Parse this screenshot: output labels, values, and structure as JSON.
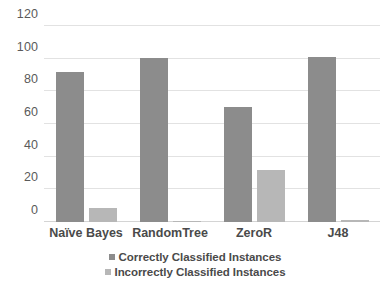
{
  "chart_data": {
    "type": "bar",
    "title": "",
    "xlabel": "",
    "ylabel": "",
    "categories": [
      "Naïve Bayes",
      "RandomTree",
      "ZeroR",
      "J48"
    ],
    "series": [
      {
        "name": "Correctly Classified Instances",
        "color": "#8c8c8c",
        "values": [
          92,
          100.7,
          70.3,
          101
        ]
      },
      {
        "name": "Incorrectly Classified Instances",
        "color": "#b7b7b7",
        "values": [
          8.5,
          0.4,
          31.6,
          1.2
        ]
      }
    ],
    "ylim": [
      0,
      120
    ],
    "yticks": [
      0,
      20,
      40,
      60,
      80,
      100,
      120
    ],
    "ytick_labels": [
      "0",
      "20",
      "40",
      "60",
      "80",
      "100",
      "120"
    ],
    "grid": true,
    "grid_color": "#e2e2e2",
    "legend_position": "bottom",
    "background": "#ffffff"
  }
}
